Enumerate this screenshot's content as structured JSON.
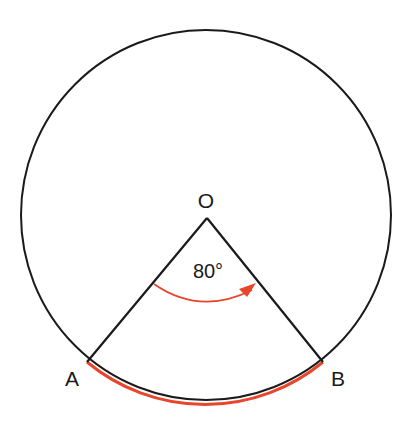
{
  "diagram": {
    "type": "circle-sector",
    "center_label": "O",
    "point_a_label": "A",
    "point_b_label": "B",
    "angle_label": "80°",
    "angle_degrees": 80,
    "colors": {
      "outline": "#1a1a1a",
      "highlight": "#e8452c"
    }
  }
}
